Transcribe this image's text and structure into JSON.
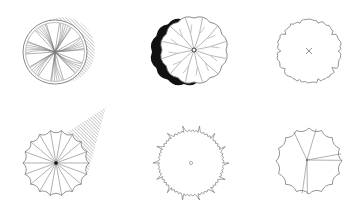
{
  "title": "Tree plan symbols",
  "colors": {
    "background": "#ffffff",
    "line": "#7a7a7a",
    "dark": "#111111",
    "hatch": "#9a9a9a"
  },
  "symbols": [
    {
      "id": "tree-1",
      "label": "Tree with radial leaf pattern and hatched shadow",
      "cx": 55,
      "cy": 52,
      "r": 32,
      "shadow": "hatched-right",
      "center": "none"
    },
    {
      "id": "tree-2",
      "label": "Scalloped tree with black shadow crescent",
      "cx": 194,
      "cy": 50,
      "r": 32,
      "shadow": "solid-left",
      "center": "small-circle"
    },
    {
      "id": "tree-3",
      "label": "Irregular outline tree with cross center",
      "cx": 309,
      "cy": 51,
      "r": 32,
      "shadow": "none",
      "center": "cross"
    },
    {
      "id": "tree-4",
      "label": "Scalloped spoked tree with hatched shadow",
      "cx": 56,
      "cy": 163,
      "r": 33,
      "shadow": "hatched-upper-right",
      "center": "dot"
    },
    {
      "id": "tree-5",
      "label": "Spiky outline tree with small circle center",
      "cx": 191,
      "cy": 163,
      "r": 34,
      "shadow": "none",
      "center": "small-circle"
    },
    {
      "id": "tree-6",
      "label": "Scalloped tree with few branches",
      "cx": 309,
      "cy": 161,
      "r": 33,
      "shadow": "none",
      "center": "dot"
    }
  ]
}
